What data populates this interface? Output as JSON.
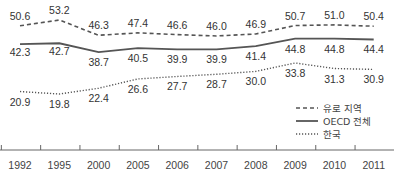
{
  "chart_data": {
    "type": "line",
    "title": "",
    "xlabel": "",
    "ylabel": "",
    "categories": [
      "1992",
      "1995",
      "2000",
      "2005",
      "2006",
      "2007",
      "2008",
      "2009",
      "2010",
      "2011"
    ],
    "series": [
      {
        "name": "유로 지역",
        "style": "dashed",
        "color": "#555555",
        "values": [
          50.6,
          53.2,
          46.3,
          47.4,
          46.6,
          46.0,
          46.9,
          50.7,
          51.0,
          50.4
        ]
      },
      {
        "name": "OECD 전체",
        "style": "solid",
        "color": "#555555",
        "values": [
          42.3,
          42.7,
          38.7,
          40.5,
          39.9,
          39.9,
          41.4,
          44.8,
          44.8,
          44.4
        ]
      },
      {
        "name": "한국",
        "style": "dotted",
        "color": "#555555",
        "values": [
          20.9,
          19.8,
          22.4,
          26.6,
          27.7,
          28.7,
          30.0,
          33.8,
          31.3,
          30.9
        ]
      }
    ],
    "grid": false,
    "legend_position": "inside-right"
  }
}
